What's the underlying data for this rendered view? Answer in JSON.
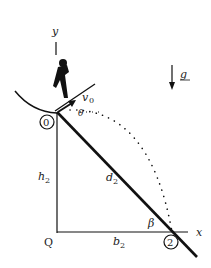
{
  "diagram": {
    "labels": {
      "y_axis": "y",
      "x_axis": "x",
      "gravity": "g",
      "velocity": "v",
      "velocity_sub": "0",
      "angle_theta": "θ",
      "angle_beta": "β",
      "height": "h",
      "height_sub": "2",
      "base": "b",
      "base_sub": "2",
      "distance": "d",
      "distance_sub": "2",
      "corner": "Q",
      "point_start": "0",
      "point_end": "2"
    },
    "colors": {
      "line": "#111111",
      "text": "#222222",
      "background": "#ffffff"
    }
  }
}
